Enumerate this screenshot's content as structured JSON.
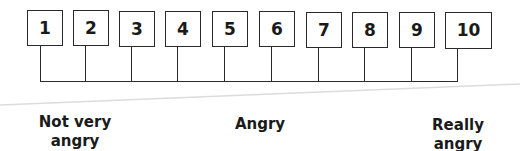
{
  "scale": {
    "title": "Anger rating scale",
    "values": [
      "1",
      "2",
      "3",
      "4",
      "5",
      "6",
      "7",
      "8",
      "9",
      "10"
    ]
  },
  "anchors": {
    "low": {
      "line1": "Not very",
      "line2": "angry"
    },
    "mid": {
      "line1": "Angry"
    },
    "high": {
      "line1": "Really",
      "line2": "angry"
    }
  },
  "colors": {
    "line": "#2a2a2a",
    "wedge": "#dcdcdc",
    "text": "#1a1a1a"
  }
}
